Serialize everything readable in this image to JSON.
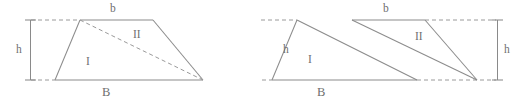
{
  "figure": {
    "title_visible": false,
    "background_color": "#ffffff",
    "line_color": "#8c8c8c",
    "text_color": "#6f6f6f",
    "width": 514,
    "height": 109,
    "construction_line_style": "dashed",
    "panels": [
      {
        "id": "left-panel",
        "name": "trapezoid-split-into-two-triangles",
        "labels": {
          "top_side": "b",
          "bottom_side": "B",
          "height": "h",
          "region_one": "I",
          "region_two": "II"
        },
        "vertices": {
          "top_left": [
            80,
            20
          ],
          "top_right": [
            153,
            20
          ],
          "bottom_right": [
            203,
            80
          ],
          "bottom_left": [
            55,
            80
          ]
        },
        "diagonal": [
          [
            80,
            20
          ],
          [
            203,
            80
          ]
        ],
        "diagonal_style": "dashed",
        "height_dimension": {
          "position": "left",
          "x": 30,
          "y_top": 20,
          "y_bottom": 80
        }
      },
      {
        "id": "right-panel",
        "name": "rearranged-triangles-between-parallel-lines",
        "labels": {
          "top_side": "b",
          "bottom_side": "B",
          "height": "h",
          "region_one": "I",
          "region_two": "II"
        },
        "vertices": {
          "top_left": [
            297,
            20
          ],
          "top_mid": [
            352,
            20
          ],
          "top_right": [
            425,
            20
          ],
          "bottom_left": [
            272,
            80
          ],
          "bottom_mid": [
            417,
            80
          ],
          "bottom_right": [
            477,
            80
          ]
        },
        "height_dimension": {
          "position": "right",
          "x": 497,
          "y_top": 20,
          "y_bottom": 80
        }
      }
    ]
  },
  "left": {
    "label_b": "b",
    "label_B": "B",
    "label_h": "h",
    "label_I": "I",
    "label_II": "II"
  },
  "right": {
    "label_b": "b",
    "label_B": "B",
    "label_h": "h",
    "label_I": "I",
    "label_II": "II"
  }
}
